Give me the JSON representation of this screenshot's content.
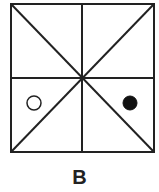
{
  "figure": {
    "label": "B",
    "stroke_color": "#222222",
    "background": "#ffffff",
    "square": {
      "x": 11,
      "y": 4,
      "width": 143,
      "height": 148
    },
    "lines": [
      "vertical-midline",
      "horizontal-midline",
      "diagonal-tl-br",
      "diagonal-tr-bl"
    ],
    "markers": [
      {
        "type": "open-circle",
        "region": "left-lower",
        "cx": 34,
        "cy": 103,
        "r": 7
      },
      {
        "type": "filled-circle",
        "region": "right-lower",
        "cx": 130,
        "cy": 103,
        "r": 7
      }
    ]
  }
}
